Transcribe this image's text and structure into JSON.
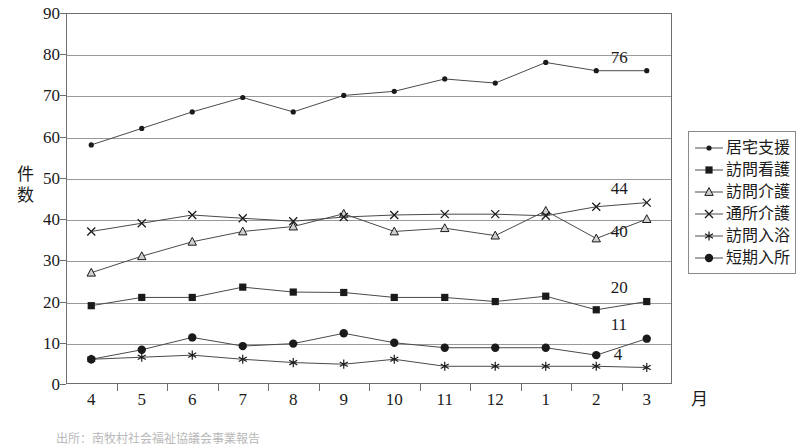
{
  "chart_data": {
    "type": "line",
    "title": "",
    "xlabel": "月",
    "ylabel": "件数",
    "ylim": [
      0,
      90
    ],
    "ytick_step": 10,
    "yticks": [
      0,
      10,
      20,
      30,
      40,
      50,
      60,
      70,
      80,
      90
    ],
    "grid": true,
    "legend_position": "right",
    "categories": [
      "4",
      "5",
      "6",
      "7",
      "8",
      "9",
      "10",
      "11",
      "12",
      "1",
      "2",
      "3"
    ],
    "series": [
      {
        "name": "居宅支援",
        "marker": "small-filled-dot",
        "values": [
          58,
          62,
          66,
          69.5,
          66,
          70,
          71,
          74,
          73,
          78,
          76,
          76
        ],
        "end_label": "76"
      },
      {
        "name": "訪問看護",
        "marker": "filled-square",
        "values": [
          19,
          21,
          21,
          23.5,
          22.3,
          22.2,
          21,
          21,
          20,
          21.3,
          18,
          20
        ],
        "end_label": "20"
      },
      {
        "name": "訪問介護",
        "marker": "open-triangle",
        "values": [
          27,
          31,
          34.5,
          37,
          38.2,
          41.3,
          37,
          37.8,
          36,
          42,
          35.3,
          40
        ],
        "end_label": "40"
      },
      {
        "name": "通所介護",
        "marker": "asterisk",
        "values": [
          6,
          6.5,
          7,
          6,
          5.2,
          4.8,
          6,
          4.3,
          4.3,
          4.3,
          4.3,
          4
        ],
        "end_label": "4"
      },
      {
        "name": "訪問入浴",
        "marker": "x-cross",
        "values": [
          37,
          39,
          41,
          40.2,
          39.5,
          40.5,
          41,
          41.2,
          41.2,
          40.8,
          43,
          44
        ],
        "end_label": "44"
      },
      {
        "name": "短期入所",
        "marker": "large-filled-circle",
        "values": [
          6,
          8.3,
          11.3,
          9.2,
          9.8,
          12.3,
          10,
          8.8,
          8.8,
          8.8,
          7,
          11
        ],
        "end_label": "11"
      }
    ]
  },
  "axis": {
    "y_title": "件数",
    "y_title_chars": [
      "件",
      "数"
    ],
    "x_title": "月"
  },
  "legend": {
    "items": [
      {
        "label": "居宅支援",
        "marker": "small-filled-dot"
      },
      {
        "label": "訪問看護",
        "marker": "filled-square"
      },
      {
        "label": "訪問介護",
        "marker": "open-triangle"
      },
      {
        "label": "通所介護",
        "marker": "x-cross"
      },
      {
        "label": "訪問入浴",
        "marker": "asterisk"
      },
      {
        "label": "短期入所",
        "marker": "large-filled-circle"
      }
    ]
  },
  "caption": "出所：南牧村社会福祉協議会事業報告",
  "colors": {
    "line": "#4a4a4a",
    "marker": "#1a1a1a",
    "grid": "#9a9a9a",
    "frame": "#6e6e6e",
    "text": "#1a1a1a"
  }
}
